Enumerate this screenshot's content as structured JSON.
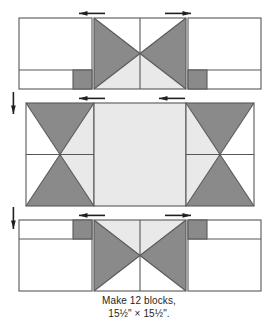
{
  "figure": {
    "name": "quilt-block-assembly-diagram",
    "type": "quilt-block-piecing-diagram",
    "colors": {
      "background": "#ffffff",
      "fabric_light": "#ffffff",
      "fabric_medium_light": "#e9e9e9",
      "fabric_dark": "#8a8a8a",
      "outline": "#58585a",
      "arrow": "#231f20",
      "text": "#231f20"
    },
    "layout": {
      "rows": 3,
      "columns": 3,
      "unit_grid": "3x3 block layout with corner units, side units and center square"
    }
  },
  "caption": {
    "line1": "Make 12 blocks,",
    "line2": "15½\" × 15½\"."
  },
  "quantity": {
    "blocks": 12,
    "finished_width": "15½\"",
    "finished_height": "15½\""
  },
  "units": [
    {
      "id": "top-left",
      "name": "corner-unit-top-left",
      "row": 1,
      "column": 1,
      "description": "Square unit with light background and small dark square at lower right of bottom strip"
    },
    {
      "id": "top-center",
      "name": "hourglass-unit-top-center",
      "row": 1,
      "column": 2,
      "description": "Quarter-square triangle X unit, dark left and right triangles, light top triangle, medium-light bottom triangle"
    },
    {
      "id": "top-right",
      "name": "corner-unit-top-right",
      "row": 1,
      "column": 3,
      "description": "Square unit with light background and small dark square at lower left of bottom strip"
    },
    {
      "id": "middle-left",
      "name": "side-unit-middle-left",
      "row": 2,
      "column": 1,
      "description": "Quarter-square triangle X unit, dark top and bottom triangles, light left triangle, medium-light right triangle"
    },
    {
      "id": "middle-center",
      "name": "center-square-unit",
      "row": 2,
      "column": 2,
      "description": "Plain medium-light square center"
    },
    {
      "id": "middle-right",
      "name": "side-unit-middle-right",
      "row": 2,
      "column": 3,
      "description": "Quarter-square triangle X unit, dark top and bottom triangles, medium-light left triangle, light right triangle"
    },
    {
      "id": "bottom-left",
      "name": "corner-unit-bottom-left",
      "row": 3,
      "column": 1,
      "description": "Square unit with light background and small dark square at upper right of top strip"
    },
    {
      "id": "bottom-center",
      "name": "hourglass-unit-bottom-center",
      "row": 3,
      "column": 2,
      "description": "Quarter-square triangle X unit, dark left and right triangles, medium-light top triangle, light bottom triangle"
    },
    {
      "id": "bottom-right",
      "name": "corner-unit-bottom-right",
      "row": 3,
      "column": 3,
      "description": "Square unit with light background and small dark square at upper left of top strip"
    }
  ],
  "pressing_arrows": [
    {
      "id": "top-row-left",
      "name": "pressing-arrow-top-row-left",
      "direction": "left",
      "row": 1
    },
    {
      "id": "top-row-right",
      "name": "pressing-arrow-top-row-right",
      "direction": "right",
      "row": 1
    },
    {
      "id": "middle-row-left",
      "name": "pressing-arrow-middle-row-left",
      "direction": "left",
      "row": 2
    },
    {
      "id": "middle-row-right",
      "name": "pressing-arrow-middle-row-right",
      "direction": "left",
      "row": 2
    },
    {
      "id": "bottom-row-left",
      "name": "pressing-arrow-bottom-row-left",
      "direction": "left",
      "row": 3
    },
    {
      "id": "bottom-row-right",
      "name": "pressing-arrow-bottom-row-right",
      "direction": "right",
      "row": 3
    },
    {
      "id": "seam-row1-row2",
      "name": "pressing-arrow-seam-top",
      "direction": "down",
      "row": 0
    },
    {
      "id": "seam-row2-row3",
      "name": "pressing-arrow-seam-bottom",
      "direction": "down",
      "row": 0
    }
  ]
}
